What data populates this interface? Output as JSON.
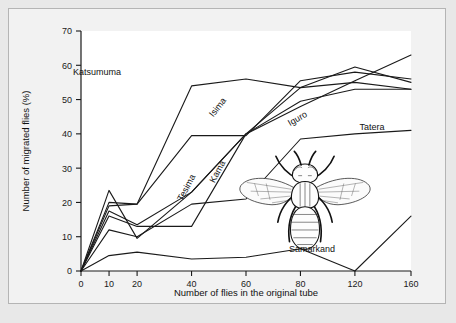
{
  "figure": {
    "background_color": "#e8e8e8",
    "panel_color": "#f2f2f2",
    "plot_color": "#ffffff",
    "line_color": "#1a1a1a",
    "illustration_name": "housefly-illustration"
  },
  "chart_data": {
    "type": "line",
    "title": "",
    "xlabel": "Number of flies in the original tube",
    "ylabel": "Number of migrated flies (%)",
    "x": [
      0,
      10,
      20,
      40,
      60,
      80,
      120,
      160
    ],
    "xtick_labels": [
      "0",
      "10",
      "20",
      "40",
      "60",
      "80",
      "120",
      "160"
    ],
    "ytick_labels": [
      "0",
      "10",
      "20",
      "30",
      "40",
      "50",
      "60",
      "70"
    ],
    "yticks": [
      0,
      10,
      20,
      30,
      40,
      50,
      60,
      70
    ],
    "ylim": [
      0,
      70
    ],
    "grid": false,
    "legend_position": "inline-labels",
    "series": [
      {
        "name": "Katsumuma",
        "label": "Katsumuma",
        "values": [
          0,
          20,
          19.5,
          54,
          56,
          53.5,
          55,
          53
        ],
        "label_x": 88,
        "label_y": 66,
        "label_rotate": 0
      },
      {
        "name": "Isima",
        "label": "Isima",
        "values": [
          0,
          19,
          19.5,
          39.5,
          39.5,
          55.5,
          58,
          56
        ],
        "label_x": 211,
        "label_y": 100,
        "label_rotate": -52
      },
      {
        "name": "Iguro",
        "label": "Iguro",
        "values": [
          0,
          17.5,
          13.5,
          23,
          40,
          49.5,
          53,
          53
        ],
        "label_x": 290,
        "label_y": 112,
        "label_rotate": -30
      },
      {
        "name": "Tesima",
        "label": "Tesima",
        "values": [
          0,
          23.5,
          9.5,
          23,
          40,
          48,
          55.5,
          63
        ],
        "label_x": 180,
        "label_y": 180,
        "label_rotate": -62
      },
      {
        "name": "Kama",
        "label": "Kama",
        "values": [
          0,
          16,
          13,
          13,
          40,
          53.5,
          59.5,
          55
        ],
        "label_x": 211,
        "label_y": 164,
        "label_rotate": -62
      },
      {
        "name": "Tatera",
        "label": "Tatera",
        "values": [
          0,
          12,
          10,
          19.5,
          21,
          38.5,
          40,
          41
        ],
        "label_x": 363,
        "label_y": 121,
        "label_rotate": 0
      },
      {
        "name": "Samarkand",
        "label": "Samarkand",
        "values": [
          0,
          4.5,
          5.5,
          3.5,
          4,
          6.5,
          0,
          16
        ],
        "label_x": 303,
        "label_y": 243,
        "label_rotate": 0
      }
    ]
  }
}
